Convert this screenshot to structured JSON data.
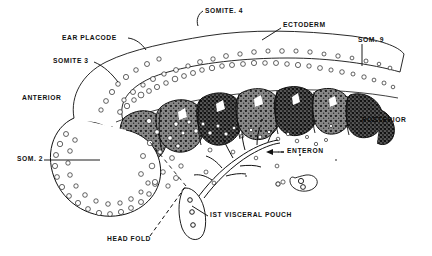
{
  "figure": {
    "kind": "embryology-whole-mount-illustration",
    "background_color": "#ffffff",
    "ink_color": "#111111",
    "tissue_fill": "#777777",
    "tissue_dark": "#1a1a1a"
  },
  "labels": [
    {
      "id": "somite-4",
      "text": "SOMITE. 4",
      "x": 205,
      "y": 8,
      "leader": "hook-down-left"
    },
    {
      "id": "ectoderm",
      "text": "ECTODERM",
      "x": 283,
      "y": 25,
      "leader": "diagonal-down-left"
    },
    {
      "id": "som-9",
      "text": "SOM. 9",
      "x": 358,
      "y": 40,
      "leader": "vertical-down"
    },
    {
      "id": "ear-placode",
      "text": "EAR PLACODE",
      "x": 62,
      "y": 39,
      "leader": "dash-right"
    },
    {
      "id": "somite-3",
      "text": "SOMITE 3",
      "x": 53,
      "y": 62,
      "leader": "diagonal-down-right"
    },
    {
      "id": "anterior",
      "text": "ANTERIOR",
      "x": 22,
      "y": 98,
      "leader": "none"
    },
    {
      "id": "posterior",
      "text": "POSTERIOR",
      "x": 362,
      "y": 120,
      "leader": "none"
    },
    {
      "id": "som-2",
      "text": "SOM. 2",
      "x": 17,
      "y": 158,
      "leader": "horizontal-right"
    },
    {
      "id": "enteron",
      "text": "ENTERON",
      "x": 285,
      "y": 150,
      "leader": "arrow-left-dashed"
    },
    {
      "id": "first-visceral-pouch",
      "text": "IST VISCERAL POUCH",
      "x": 210,
      "y": 215,
      "leader": "diagonal-up-left"
    },
    {
      "id": "head-fold",
      "text": "HEAD FOLD",
      "x": 107,
      "y": 240,
      "leader": "dashed-up-right"
    }
  ]
}
